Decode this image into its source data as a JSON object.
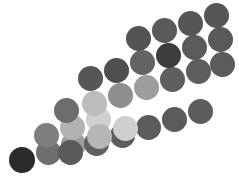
{
  "canvas": {
    "width": 239,
    "height": 179,
    "background": "#ffffff",
    "title": "Diagonal band of grayscale dots"
  },
  "chart_data": {
    "type": "scatter",
    "subtitle": "",
    "xlabel": "",
    "ylabel": "",
    "xlim": [
      0,
      239
    ],
    "ylim": [
      0,
      179
    ],
    "grid": false,
    "legend": false,
    "marker": "circle",
    "marker_diameter": 24,
    "colorscale": "grayscale",
    "rows": 3,
    "points": [
      {
        "id": "p01",
        "row": 2,
        "col": 0,
        "cx": 22,
        "cy": 160,
        "d": 24,
        "color": "#2b2b2b",
        "gray": 43
      },
      {
        "id": "p02",
        "row": 2,
        "col": 1,
        "cx": 48,
        "cy": 152,
        "d": 24,
        "color": "#6f6f6f",
        "gray": 111
      },
      {
        "id": "p03",
        "row": 2,
        "col": 2,
        "cx": 74,
        "cy": 144,
        "d": 24,
        "color": "#9a9a9a",
        "gray": 154
      },
      {
        "id": "p04",
        "row": 2,
        "col": 3,
        "cx": 100,
        "cy": 136,
        "d": 24,
        "color": "#b5b5b5",
        "gray": 181
      },
      {
        "id": "p05",
        "row": 2,
        "col": 4,
        "cx": 126,
        "cy": 128,
        "d": 24,
        "color": "#cfcfcf",
        "gray": 207
      },
      {
        "id": "p06",
        "row": 1,
        "col": 2,
        "cx": 76,
        "cy": 118,
        "d": 24,
        "color": "#b0b0b0",
        "gray": 176
      },
      {
        "id": "p07",
        "row": 1,
        "col": 3,
        "cx": 102,
        "cy": 110,
        "d": 24,
        "color": "#d2d2d2",
        "gray": 210
      },
      {
        "id": "p08",
        "row": 1,
        "col": 4,
        "cx": 128,
        "cy": 102,
        "d": 24,
        "color": "#bdbdbd",
        "gray": 189
      },
      {
        "id": "p09",
        "row": 2,
        "col": 5,
        "cx": 152,
        "cy": 120,
        "d": 24,
        "color": "#5a5a5a",
        "gray": 90
      },
      {
        "id": "p10",
        "row": 2,
        "col": 6,
        "cx": 178,
        "cy": 112,
        "d": 24,
        "color": "#5e5e5e",
        "gray": 94
      },
      {
        "id": "p11",
        "row": 1,
        "col": 5,
        "cx": 154,
        "cy": 94,
        "d": 24,
        "color": "#8e8e8e",
        "gray": 142
      },
      {
        "id": "p12",
        "row": 1,
        "col": 6,
        "cx": 180,
        "cy": 86,
        "d": 24,
        "color": "#9b9b9b",
        "gray": 155
      },
      {
        "id": "p13",
        "row": 0,
        "col": 4,
        "cx": 130,
        "cy": 76,
        "d": 24,
        "color": "#656565",
        "gray": 101
      },
      {
        "id": "p14",
        "row": 0,
        "col": 5,
        "cx": 156,
        "cy": 68,
        "d": 24,
        "color": "#636363",
        "gray": 99
      },
      {
        "id": "p15",
        "row": 0,
        "col": 6,
        "cx": 182,
        "cy": 60,
        "d": 24,
        "color": "#3d3d3d",
        "gray": 61
      },
      {
        "id": "p16",
        "row": 2,
        "col": 7,
        "cx": 204,
        "cy": 104,
        "d": 24,
        "color": "#5c5c5c",
        "gray": 92
      },
      {
        "id": "p17",
        "row": 1,
        "col": 7,
        "cx": 206,
        "cy": 78,
        "d": 24,
        "color": "#5f5f5f",
        "gray": 95
      },
      {
        "id": "p18",
        "row": 0,
        "col": 7,
        "cx": 208,
        "cy": 52,
        "d": 24,
        "color": "#5b5b5b",
        "gray": 91
      },
      {
        "id": "p19",
        "row": 2,
        "col": 3,
        "cx": 74,
        "cy": 108,
        "d": 24,
        "color": "#6b6b6b",
        "gray": 107
      },
      {
        "id": "p20",
        "row": 3,
        "col": 3,
        "cx": 72,
        "cy": 150,
        "d": 24,
        "color": "#5a5a5a",
        "gray": 90
      },
      {
        "id": "p21",
        "row": 3,
        "col": 4,
        "cx": 98,
        "cy": 142,
        "d": 24,
        "color": "#616161",
        "gray": 97
      },
      {
        "id": "p22",
        "row": 3,
        "col": 5,
        "cx": 124,
        "cy": 134,
        "d": 24,
        "color": "#5d5d5d",
        "gray": 93
      },
      {
        "id": "p23",
        "row": 0,
        "col": 3,
        "cx": 104,
        "cy": 84,
        "d": 24,
        "color": "#4f4f4f",
        "gray": 79
      },
      {
        "id": "p24",
        "row": 0,
        "col": 2,
        "cx": 78,
        "cy": 92,
        "d": 24,
        "color": "#565656",
        "gray": 86
      },
      {
        "id": "p25",
        "row": -1,
        "col": 5,
        "cx": 158,
        "cy": 42,
        "d": 24,
        "color": "#545454",
        "gray": 84
      },
      {
        "id": "p26",
        "row": -1,
        "col": 6,
        "cx": 184,
        "cy": 34,
        "d": 24,
        "color": "#5a5a5a",
        "gray": 90
      },
      {
        "id": "p27",
        "row": -1,
        "col": 7,
        "cx": 210,
        "cy": 26,
        "d": 24,
        "color": "#555555",
        "gray": 85
      },
      {
        "id": "p28",
        "row": -2,
        "col": 7,
        "cx": 212,
        "cy": 14,
        "d": 24,
        "color": "#565656",
        "gray": 86
      },
      {
        "id": "p29",
        "row": 1,
        "col": 1,
        "cx": 50,
        "cy": 126,
        "d": 24,
        "color": "#8c8c8c",
        "gray": 140
      },
      {
        "id": "p30",
        "row": 0,
        "col": 1,
        "cx": 48,
        "cy": 134,
        "d": 24,
        "color": "#7f7f7f",
        "gray": 127
      }
    ]
  },
  "dots": [
    {
      "name": "dot-r3-c0",
      "cx": 22,
      "cy": 160,
      "d": 26,
      "color": "#2b2b2b"
    },
    {
      "name": "dot-r3-c1",
      "cx": 48,
      "cy": 152,
      "d": 25,
      "color": "#6e6e6e"
    },
    {
      "name": "dot-r3-c2",
      "cx": 73,
      "cy": 144,
      "d": 25,
      "color": "#9c9c9c"
    },
    {
      "name": "dot-r3-c3",
      "cx": 70,
      "cy": 152,
      "d": 25,
      "color": "#5a5a5a"
    },
    {
      "name": "dot-r2-c2",
      "cx": 72,
      "cy": 127,
      "d": 25,
      "color": "#b2b2b2"
    },
    {
      "name": "dot-r2-c3",
      "cx": 98,
      "cy": 119,
      "d": 25,
      "color": "#d0d0d0"
    },
    {
      "name": "dot-r2-c4",
      "cx": 96,
      "cy": 143,
      "d": 25,
      "color": "#606060"
    },
    {
      "name": "dot-r2-c5",
      "cx": 122,
      "cy": 135,
      "d": 25,
      "color": "#5d5d5d"
    },
    {
      "name": "dot-r2-c6",
      "cx": 148,
      "cy": 127,
      "d": 25,
      "color": "#5c5c5c"
    },
    {
      "name": "dot-r2-c7",
      "cx": 174,
      "cy": 119,
      "d": 25,
      "color": "#5b5b5b"
    },
    {
      "name": "dot-r2-c8",
      "cx": 200,
      "cy": 111,
      "d": 25,
      "color": "#5c5c5c"
    },
    {
      "name": "dot-r1-c2",
      "cx": 66,
      "cy": 110,
      "d": 25,
      "color": "#6d6d6d"
    },
    {
      "name": "dot-r1-c3",
      "cx": 94,
      "cy": 103,
      "d": 25,
      "color": "#bcbcbc"
    },
    {
      "name": "dot-r1-c4",
      "cx": 120,
      "cy": 95,
      "d": 25,
      "color": "#8e8e8e"
    },
    {
      "name": "dot-r1-c5",
      "cx": 146,
      "cy": 87,
      "d": 25,
      "color": "#9d9d9d"
    },
    {
      "name": "dot-r1-c6",
      "cx": 172,
      "cy": 79,
      "d": 25,
      "color": "#5f5f5f"
    },
    {
      "name": "dot-r1-c7",
      "cx": 198,
      "cy": 71,
      "d": 25,
      "color": "#5e5e5e"
    },
    {
      "name": "dot-r1-c8",
      "cx": 222,
      "cy": 64,
      "d": 25,
      "color": "#5b5b5b"
    },
    {
      "name": "dot-r0-c3",
      "cx": 90,
      "cy": 78,
      "d": 25,
      "color": "#565656"
    },
    {
      "name": "dot-r0-c4",
      "cx": 116,
      "cy": 70,
      "d": 25,
      "color": "#4f4f4f"
    },
    {
      "name": "dot-r0-c5",
      "cx": 142,
      "cy": 62,
      "d": 25,
      "color": "#636363"
    },
    {
      "name": "dot-r0-c6",
      "cx": 168,
      "cy": 55,
      "d": 25,
      "color": "#3d3d3d"
    },
    {
      "name": "dot-r0-c7",
      "cx": 194,
      "cy": 47,
      "d": 25,
      "color": "#5b5b5b"
    },
    {
      "name": "dot-r0-c8",
      "cx": 220,
      "cy": 39,
      "d": 25,
      "color": "#5a5a5a"
    },
    {
      "name": "dot-rt-c5",
      "cx": 138,
      "cy": 38,
      "d": 25,
      "color": "#545454"
    },
    {
      "name": "dot-rt-c6",
      "cx": 164,
      "cy": 30,
      "d": 25,
      "color": "#5a5a5a"
    },
    {
      "name": "dot-rt-c7",
      "cx": 190,
      "cy": 23,
      "d": 25,
      "color": "#555555"
    },
    {
      "name": "dot-rt-c8",
      "cx": 216,
      "cy": 15,
      "d": 25,
      "color": "#565656"
    },
    {
      "name": "dot-r3-c4",
      "cx": 99,
      "cy": 136,
      "d": 25,
      "color": "#b6b6b6"
    },
    {
      "name": "dot-r3-c5",
      "cx": 125,
      "cy": 128,
      "d": 25,
      "color": "#cfcfcf"
    },
    {
      "name": "dot-edge-a",
      "cx": 46,
      "cy": 135,
      "d": 25,
      "color": "#7e7e7e"
    }
  ]
}
